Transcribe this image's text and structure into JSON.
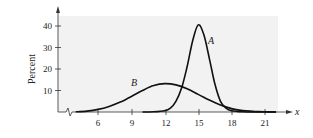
{
  "chart_data": {
    "type": "line",
    "title": "",
    "xlabel": "x",
    "ylabel": "Percent",
    "xlim": [
      4,
      22.5
    ],
    "ylim": [
      0,
      44
    ],
    "x_ticks": [
      6,
      9,
      12,
      15,
      18,
      21
    ],
    "y_ticks": [
      10,
      20,
      30,
      40
    ],
    "grid": false,
    "axis_break": true,
    "series": [
      {
        "name": "A",
        "x": [
          10,
          11,
          12,
          12.5,
          13,
          13.5,
          14,
          14.5,
          15,
          15.5,
          16,
          16.5,
          17,
          17.5,
          18,
          19,
          20,
          21,
          22
        ],
        "values": [
          0,
          0.1,
          0.6,
          1.8,
          5,
          11,
          21,
          33,
          40.5,
          36,
          25,
          13,
          5,
          1.8,
          0.6,
          0.1,
          0,
          0,
          0
        ]
      },
      {
        "name": "B",
        "x": [
          4,
          5,
          6,
          7,
          8,
          9,
          10,
          11,
          12,
          13,
          14,
          15,
          16,
          17,
          18,
          19,
          20,
          21,
          22
        ],
        "values": [
          0.1,
          0.4,
          1.2,
          2.6,
          4.6,
          7.2,
          10,
          12.3,
          13.2,
          12.6,
          10.8,
          8.2,
          5.6,
          3.2,
          1.6,
          0.7,
          0.3,
          0.1,
          0
        ]
      }
    ]
  },
  "labels": {
    "ylabel": "Percent",
    "xlabel": "x",
    "series_a": "A",
    "series_b": "B",
    "x_ticks": [
      "6",
      "9",
      "12",
      "15",
      "18",
      "21"
    ],
    "y_ticks": [
      "10",
      "20",
      "30",
      "40"
    ]
  },
  "colors": {
    "plot_bg": "#f2f2f2",
    "line": "#111111"
  }
}
